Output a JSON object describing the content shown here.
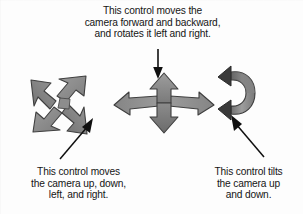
{
  "figure": {
    "background_color": "#fdfdfd",
    "text_color": "#151515",
    "arrow_fill": "#8a8a8a",
    "arrow_fill_light": "#a6a6a6",
    "arrow_fill_dark": "#6d6d6d",
    "arrow_outline": "#3c3c3c",
    "pointer_color": "#101010"
  },
  "captions": {
    "top": {
      "lines": [
        "This control moves the",
        "camera forward and backward,",
        "and rotates it left and right."
      ]
    },
    "bottom_left": {
      "lines": [
        "This control moves",
        "the camera up, down,",
        "left, and right."
      ]
    },
    "bottom_right": {
      "lines": [
        "This control tilts",
        "the camera up",
        "and down."
      ]
    }
  },
  "widgets": {
    "pan": {
      "name": "four-way-diagonal-arrow-widget",
      "description": "Four-pointed diagonal star arrow"
    },
    "move": {
      "name": "forward-backward-rotate-widget",
      "description": "Up and down arrows with swept left and right wing arrows"
    },
    "tilt": {
      "name": "tilt-band-widget",
      "description": "Vertical curved 3D band with arrowheads at top and bottom"
    }
  },
  "pointers": {
    "top": {
      "name": "pointer-arrow-down"
    },
    "bottom_left": {
      "name": "pointer-arrow-up-right"
    },
    "bottom_right": {
      "name": "pointer-arrow-up-left"
    }
  }
}
